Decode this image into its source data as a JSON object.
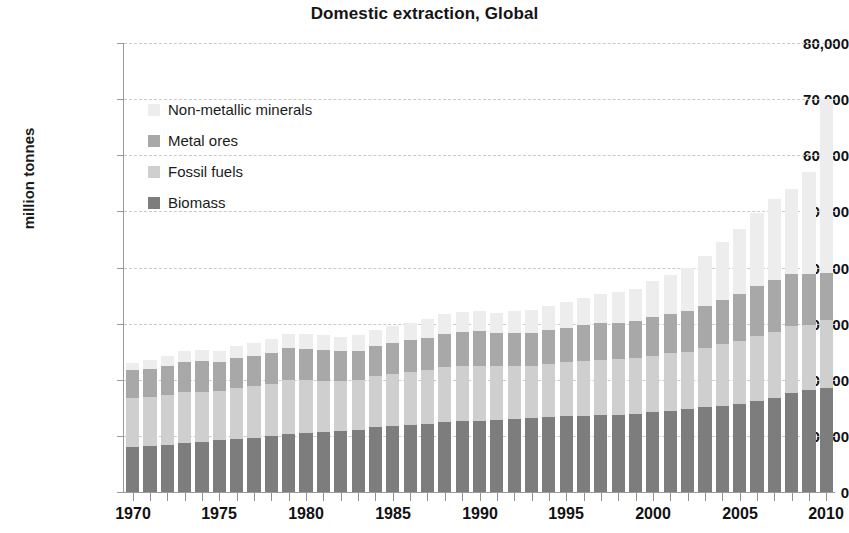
{
  "chart_data": {
    "type": "bar",
    "subtype": "stacked-bar",
    "title": "Domestic extraction, Global",
    "xlabel": "",
    "ylabel": "million tonnes",
    "ylim": [
      0,
      80000
    ],
    "ytick_labels": [
      "0",
      "10,000",
      "20,000",
      "30,000",
      "40,000",
      "50,000",
      "60,000",
      "70,000",
      "80,000"
    ],
    "ytick_values": [
      0,
      10000,
      20000,
      30000,
      40000,
      50000,
      60000,
      70000,
      80000
    ],
    "grid": true,
    "legend_position": "upper-left-inside",
    "x": [
      1970,
      1971,
      1972,
      1973,
      1974,
      1975,
      1976,
      1977,
      1978,
      1979,
      1980,
      1981,
      1982,
      1983,
      1984,
      1985,
      1986,
      1987,
      1988,
      1989,
      1990,
      1991,
      1992,
      1993,
      1994,
      1995,
      1996,
      1997,
      1998,
      1999,
      2000,
      2001,
      2002,
      2003,
      2004,
      2005,
      2006,
      2007,
      2008,
      2009,
      2010
    ],
    "xtick_labels": [
      "1970",
      "1975",
      "1980",
      "1985",
      "1990",
      "1995",
      "2000",
      "2005",
      "2010"
    ],
    "xtick_values": [
      1970,
      1975,
      1980,
      1985,
      1990,
      1995,
      2000,
      2005,
      2010
    ],
    "series": [
      {
        "name": "Biomass",
        "color": "#7d7d7d",
        "stack_order": 1,
        "values": [
          8100,
          8200,
          8400,
          8700,
          8900,
          9200,
          9400,
          9700,
          10000,
          10400,
          10500,
          10700,
          10900,
          11100,
          11500,
          11700,
          12000,
          12200,
          12500,
          12600,
          12700,
          12800,
          13000,
          13100,
          13300,
          13500,
          13600,
          13700,
          13800,
          13900,
          14200,
          14500,
          14800,
          15100,
          15400,
          15700,
          16300,
          16800,
          17600,
          18200,
          18600
        ]
      },
      {
        "name": "Fossil fuels",
        "color": "#cfcfcf",
        "stack_order": 2,
        "values": [
          8600,
          8700,
          8900,
          9100,
          9000,
          8800,
          9100,
          9200,
          9300,
          9600,
          9400,
          9100,
          8900,
          8800,
          9100,
          9300,
          9400,
          9500,
          9700,
          9800,
          9800,
          9600,
          9500,
          9400,
          9500,
          9600,
          9800,
          9900,
          9900,
          9900,
          10100,
          10200,
          10200,
          10500,
          10900,
          11200,
          11500,
          11700,
          11900,
          11500,
          12100
        ]
      },
      {
        "name": "Metal ores",
        "color": "#a8a8a8",
        "stack_order": 3,
        "values": [
          5000,
          5100,
          5200,
          5400,
          5400,
          5200,
          5400,
          5400,
          5500,
          5600,
          5600,
          5500,
          5300,
          5300,
          5500,
          5600,
          5700,
          5800,
          6000,
          6100,
          6100,
          5900,
          5900,
          5900,
          6000,
          6200,
          6300,
          6500,
          6500,
          6600,
          6900,
          7000,
          7200,
          7600,
          8000,
          8400,
          8900,
          9300,
          9400,
          9100,
          8400
        ]
      },
      {
        "name": "Non-metallic minerals",
        "color": "#ededed",
        "stack_order": 4,
        "values": [
          1300,
          1500,
          1700,
          1900,
          2000,
          2000,
          2200,
          2300,
          2500,
          2600,
          2600,
          2600,
          2600,
          2700,
          2800,
          2900,
          3100,
          3300,
          3500,
          3600,
          3700,
          3600,
          3800,
          4000,
          4300,
          4500,
          4800,
          5100,
          5400,
          5800,
          6400,
          7000,
          7700,
          8800,
          10200,
          11500,
          13000,
          14400,
          15100,
          18200,
          30900
        ]
      }
    ],
    "totals": [
      23000,
      23500,
      24200,
      25100,
      25300,
      25200,
      26100,
      26600,
      27300,
      28200,
      28100,
      27900,
      27700,
      27900,
      28900,
      29500,
      30200,
      30800,
      31700,
      32100,
      32300,
      31900,
      32200,
      32400,
      33100,
      33800,
      34500,
      35200,
      35600,
      36200,
      37600,
      38700,
      39900,
      42000,
      44500,
      46800,
      49700,
      52200,
      54000,
      57000,
      70000
    ]
  },
  "colors": {
    "background": "#ffffff",
    "gridline": "#c9c9c9",
    "axis": "#9a9a9a",
    "text": "#111111"
  }
}
